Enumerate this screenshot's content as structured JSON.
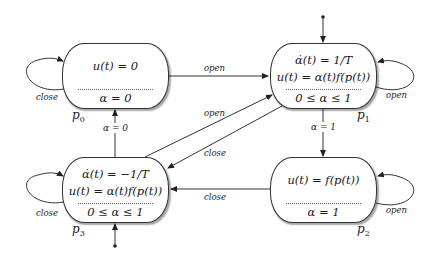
{
  "states": {
    "p0": {
      "name": "p",
      "index": "0",
      "flow": [
        "u(t) = 0"
      ],
      "invariant": "α = 0"
    },
    "p1": {
      "name": "p",
      "index": "1",
      "flow": [
        "α̇(t) = 1/T",
        "u(t) = α(t)f(p(t))"
      ],
      "invariant": "0 ≤ α ≤ 1"
    },
    "p2": {
      "name": "p",
      "index": "2",
      "flow": [
        "u(t) = f(p(t))"
      ],
      "invariant": "α = 1"
    },
    "p3": {
      "name": "p",
      "index": "3",
      "flow": [
        "α̇(t) = −1/T",
        "u(t) = α(t)f(p(t))"
      ],
      "invariant": "0 ≤ α ≤ 1"
    }
  },
  "edges": {
    "p0_self": "close",
    "p1_self": "open",
    "p2_self": "open",
    "p3_self": "close",
    "p0_to_p1": "open",
    "p3_to_p1": "open",
    "p1_to_p3": "close",
    "p2_to_p3": "close",
    "p1_to_p2_guard": "α = 1",
    "p3_to_p0_guard": "α = 0"
  },
  "colors": {
    "stroke": "#333333",
    "background": "#ffffff"
  }
}
